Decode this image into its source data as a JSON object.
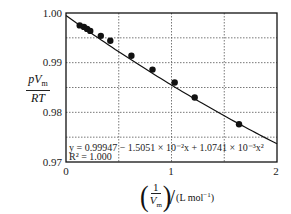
{
  "chart_data": {
    "type": "scatter",
    "title": "",
    "xlabel": "(1/V_m)/(L mol^-1)",
    "ylabel": "pV_m/RT",
    "xlim": [
      0,
      2
    ],
    "ylim": [
      0.97,
      1.0
    ],
    "grid": true,
    "x_ticks": [
      "0",
      "1",
      "2"
    ],
    "y_ticks": [
      "1.00",
      "0.99",
      "0.98",
      "0.97"
    ],
    "series": [
      {
        "name": "data",
        "x": [
          0.13,
          0.17,
          0.2,
          0.23,
          0.33,
          0.42,
          0.62,
          0.82,
          1.03,
          1.22,
          1.64
        ],
        "y": [
          0.9975,
          0.9972,
          0.9968,
          0.9964,
          0.9954,
          0.9944,
          0.9914,
          0.9886,
          0.986,
          0.983,
          0.9776
        ]
      }
    ],
    "fit": {
      "equation": "y = 0.99947 − 1.5051 × 10⁻²x + 1.0741 × 10⁻³x²",
      "r_squared": "R² = 1.000",
      "coefficients": [
        0.99947,
        -0.015051,
        0.0010741
      ]
    }
  },
  "labels": {
    "y_num": "pV",
    "y_num_sub": "m",
    "y_den": "RT",
    "x_frac_num": "1",
    "x_frac_den": "V",
    "x_frac_den_sub": "m",
    "x_unit": "(L mol",
    "x_unit_sup": "−1",
    "x_unit_close": ")",
    "equation": "y = 0.99947 − 1.5051 × 10⁻²x + 1.0741 × 10⁻³x²",
    "r2": "R² = 1.000",
    "tick_y": [
      "1.00",
      "0.99",
      "0.98",
      "0.97"
    ],
    "tick_x": [
      "0",
      "1",
      "2"
    ]
  }
}
